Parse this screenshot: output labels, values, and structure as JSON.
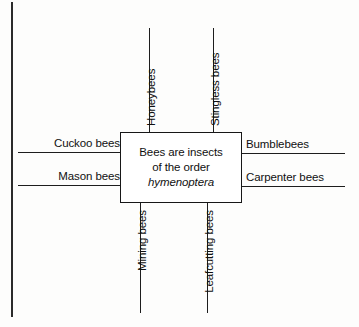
{
  "diagram": {
    "type": "concept-map",
    "center": {
      "lines": [
        {
          "text": "Bees are insects",
          "italic": false
        },
        {
          "text": "of the order",
          "italic": false
        },
        {
          "text": "hymenoptera",
          "italic": true
        }
      ]
    },
    "branches": [
      {
        "id": "cuckoo-bees",
        "label": "Cuckoo bees",
        "side": "left",
        "orientation": "horizontal"
      },
      {
        "id": "mason-bees",
        "label": "Mason bees",
        "side": "left",
        "orientation": "horizontal"
      },
      {
        "id": "bumblebees",
        "label": "Bumblebees",
        "side": "right",
        "orientation": "horizontal"
      },
      {
        "id": "carpenter-bees",
        "label": "Carpenter bees",
        "side": "right",
        "orientation": "horizontal"
      },
      {
        "id": "honeybees",
        "label": "Honeybees",
        "side": "top",
        "orientation": "vertical"
      },
      {
        "id": "stingless-bees",
        "label": "Stingless bees",
        "side": "top",
        "orientation": "vertical"
      },
      {
        "id": "mining-bees",
        "label": "Mining bees",
        "side": "bottom",
        "orientation": "vertical"
      },
      {
        "id": "leafcutting-bees",
        "label": "Leafcutting bees",
        "side": "bottom",
        "orientation": "vertical"
      }
    ],
    "colors": {
      "line": "#1d1d1d",
      "text": "#101010",
      "box_border": "#171717",
      "box_fill": "#ffffff",
      "background": "#fdfdfc"
    }
  }
}
